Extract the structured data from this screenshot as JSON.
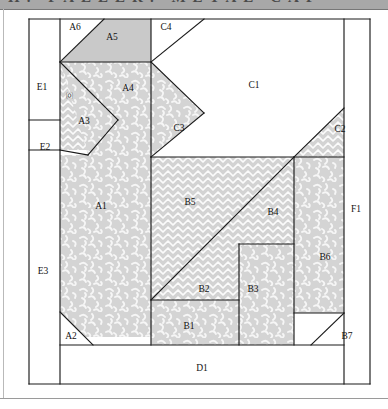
{
  "header": {
    "band_text": "H. FALLER. METAL CAP"
  },
  "diagram": {
    "colors": {
      "line": "#1a1a1a",
      "solid_gray": "#c9c9c9",
      "speckle_base": "#d2d2d2",
      "speckle_mark": "#f4f4f4",
      "brick_base": "#d2d2d2",
      "brick_line": "#ffffff",
      "white": "#ffffff",
      "frame": "#1a1a1a"
    },
    "frame": {
      "x": 28,
      "y": 16,
      "width": 343,
      "height": 369
    },
    "fill_legend": [
      {
        "key": "white",
        "label": "plain / background"
      },
      {
        "key": "solid",
        "label": "solid gray"
      },
      {
        "key": "speckle",
        "label": "speckled vermicelli print"
      },
      {
        "key": "brick",
        "label": "zigzag brick print"
      }
    ],
    "pieces": [
      {
        "id": "A1",
        "label": "A1",
        "fill": "speckle",
        "lx": 101,
        "ly": 207,
        "points": "60,155 151,155 151,337 60,337"
      },
      {
        "id": "A2",
        "label": "A2",
        "fill": "white",
        "lx": 71,
        "ly": 337,
        "points": "60,312 60,345 93,345"
      },
      {
        "id": "A3",
        "label": "A3",
        "fill": "brick",
        "lx": 84,
        "ly": 122,
        "points": "60,62 118,120 88,150 60,150"
      },
      {
        "id": "A4",
        "label": "A4",
        "fill": "speckle",
        "lx": 128,
        "ly": 89,
        "points": "60,62 151,62 151,155 88,155"
      },
      {
        "id": "A5",
        "label": "A5",
        "fill": "solid",
        "lx": 112,
        "ly": 38,
        "points": "60,62 104,19 151,19 151,62"
      },
      {
        "id": "A6",
        "label": "A6",
        "fill": "white",
        "lx": 75,
        "ly": 28,
        "points": "60,19 104,19 60,62"
      },
      {
        "id": "A0",
        "label": "⒪",
        "fill": "none",
        "lx": 69,
        "ly": 96,
        "tiny": true
      },
      {
        "id": "B1",
        "label": "B1",
        "fill": "speckle",
        "lx": 189,
        "ly": 327,
        "points": "151,300 239,300 239,345 151,345"
      },
      {
        "id": "B2",
        "label": "B2",
        "fill": "brick",
        "lx": 204,
        "ly": 290,
        "points": "151,300 207,244 239,244 239,300"
      },
      {
        "id": "B3",
        "label": "B3",
        "fill": "speckle",
        "lx": 253,
        "ly": 290,
        "points": "239,244 294,244 294,345 239,345"
      },
      {
        "id": "B4",
        "label": "B4",
        "fill": "brick",
        "lx": 273,
        "ly": 213,
        "points": "252,199 294,157 294,244 207,244"
      },
      {
        "id": "B5",
        "label": "B5",
        "fill": "brick",
        "lx": 190,
        "ly": 203,
        "points": "151,157 294,157 207,244 151,300"
      },
      {
        "id": "B6",
        "label": "B6",
        "fill": "speckle",
        "lx": 325,
        "ly": 258,
        "points": "294,157 344,157 344,313 294,313"
      },
      {
        "id": "B7",
        "label": "B7",
        "fill": "white",
        "lx": 347,
        "ly": 337,
        "points": "344,313 344,345 311,345"
      },
      {
        "id": "C1",
        "label": "C1",
        "fill": "white",
        "lx": 254,
        "ly": 86,
        "points": "151,62 204,19 344,19 344,108 294,157 151,157"
      },
      {
        "id": "C2",
        "label": "C2",
        "fill": "brick",
        "lx": 340,
        "ly": 130,
        "points": "344,108 344,157 294,157"
      },
      {
        "id": "C3",
        "label": "C3",
        "fill": "speckle",
        "lx": 179,
        "ly": 129,
        "points": "151,62 204,113 151,157"
      },
      {
        "id": "C4",
        "label": "C4",
        "fill": "white",
        "lx": 166,
        "ly": 28,
        "points": "151,19 204,19 151,62"
      },
      {
        "id": "D1",
        "label": "D1",
        "fill": "white",
        "lx": 202,
        "ly": 369,
        "points": "60,345 344,345 344,384 60,384"
      },
      {
        "id": "E1",
        "label": "E1",
        "fill": "white",
        "lx": 42,
        "ly": 88,
        "points": "29,19 60,19 60,120 29,120"
      },
      {
        "id": "E2",
        "label": "E2",
        "fill": "white",
        "lx": 45,
        "ly": 148,
        "points": "29,120 60,120 60,150 29,150"
      },
      {
        "id": "E3",
        "label": "E3",
        "fill": "white",
        "lx": 43,
        "ly": 272,
        "points": "29,150 60,150 60,384 29,384"
      },
      {
        "id": "F1",
        "label": "F1",
        "fill": "white",
        "lx": 356,
        "ly": 210,
        "points": "344,19 370,19 370,384 344,384"
      }
    ],
    "edges": [
      "29,19 370,19",
      "29,384 370,384",
      "29,19 29,384",
      "370,19 370,384",
      "60,19 60,384",
      "344,19 344,384",
      "60,345 344,345",
      "104,19 60,62",
      "60,62 151,62",
      "151,19 151,157",
      "204,19 151,62",
      "60,120 29,120",
      "29,150 60,150",
      "60,62 118,120",
      "118,120 88,155",
      "60,150 88,155",
      "151,62 204,113",
      "204,113 151,157",
      "344,108 294,157",
      "151,157 344,157",
      "151,157 151,345",
      "294,157 294,345",
      "151,300 294,157",
      "239,244 294,244",
      "239,244 239,345",
      "151,300 239,300",
      "60,312 93,345",
      "344,313 311,345",
      "294,313 344,313"
    ]
  }
}
